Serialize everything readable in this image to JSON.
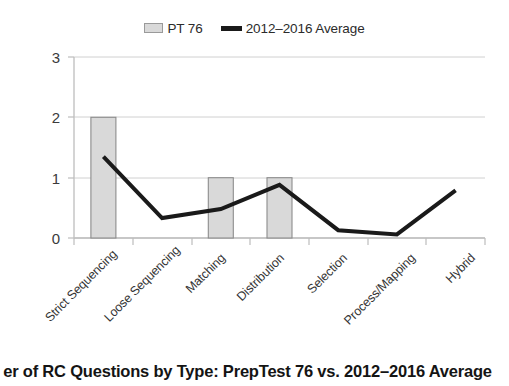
{
  "legend": {
    "position": "top-center",
    "entries": [
      {
        "label": "PT 76",
        "type": "bar",
        "color": "#D9D9D9",
        "border": "#808080",
        "icon": "bar-swatch-icon"
      },
      {
        "label": "2012–2016 Average",
        "type": "line",
        "color": "#1A1A1A",
        "icon": "line-swatch-icon"
      }
    ]
  },
  "caption": {
    "text": "er of RC Questions by Type: PrepTest 76 vs. 2012–2016 Average",
    "note_clipped": "clipped"
  },
  "axes": {
    "y_ticks": [
      "0",
      "1",
      "2",
      "3"
    ],
    "x_tick_labels": [
      "Strict Sequencing",
      "Loose Sequencing",
      "Matching",
      "Distribution",
      "Selection",
      "Process/Mapping",
      "Hybrid"
    ]
  },
  "chart_data": {
    "type": "bar",
    "title": "er of RC Questions by Type: PrepTest 76 vs. 2012–2016 Average",
    "xlabel": "",
    "ylabel": "",
    "ylim": [
      0,
      3
    ],
    "yticks": [
      0,
      1,
      2,
      3
    ],
    "grid": true,
    "legend_position": "top-center",
    "categories": [
      "Strict Sequencing",
      "Loose Sequencing",
      "Matching",
      "Distribution",
      "Selection",
      "Process/Mapping",
      "Hybrid"
    ],
    "series": [
      {
        "name": "PT 76",
        "type": "bar",
        "color": "#D9D9D9",
        "edgecolor": "#808080",
        "values": [
          2,
          0,
          1,
          1,
          0,
          0,
          0
        ]
      },
      {
        "name": "2012–2016 Average",
        "type": "line",
        "color": "#1A1A1A",
        "linewidth": 4,
        "values": [
          1.35,
          0.33,
          0.48,
          0.88,
          0.13,
          0.06,
          0.79
        ]
      }
    ]
  }
}
